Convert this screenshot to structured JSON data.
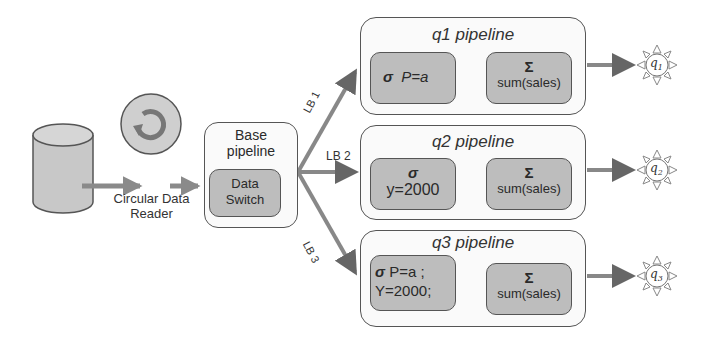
{
  "diagram": {
    "source": {
      "name": "database"
    },
    "reader": {
      "label_line1": "Circular Data",
      "label_line2": "Reader"
    },
    "base_pipeline": {
      "title_line1": "Base",
      "title_line2": "pipeline",
      "switch_line1": "Data",
      "switch_line2": "Switch"
    },
    "load_balancers": [
      {
        "label": "LB 1"
      },
      {
        "label": "LB 2"
      },
      {
        "label": "LB 3"
      }
    ],
    "pipelines": [
      {
        "title": "q1 pipeline",
        "filter_symbol": "σ",
        "filter_line1": "P=a",
        "filter_line2": "",
        "agg_symbol": "Σ",
        "agg_label": "sum(sales)",
        "output": "q",
        "output_sub": "1"
      },
      {
        "title": "q2 pipeline",
        "filter_symbol": "σ",
        "filter_line1": "y=2000",
        "filter_line2": "",
        "agg_symbol": "Σ",
        "agg_label": "sum(sales)",
        "output": "q",
        "output_sub": "2"
      },
      {
        "title": "q3 pipeline",
        "filter_symbol": "σ",
        "filter_line1": "P=a ;",
        "filter_line2": "Y=2000;",
        "agg_symbol": "Σ",
        "agg_label": "sum(sales)",
        "output": "q",
        "output_sub": "3"
      }
    ],
    "colors": {
      "box_fill": "#bdbdbd",
      "stroke": "#555555",
      "arrow": "#6e6e6e",
      "container_fill": "#fafafa"
    }
  }
}
